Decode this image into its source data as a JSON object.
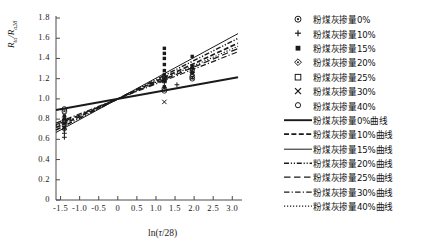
{
  "chart_data": {
    "type": "scatter",
    "title": "",
    "xlabel": "ln(τ/28)",
    "ylabel": "R_ta/R_a28",
    "xlim": [
      -1.62,
      3.15
    ],
    "ylim": [
      0,
      1.8
    ],
    "xticks": [
      "-1.5",
      "-1.0",
      "-0.5",
      "0",
      "0.5",
      "1.0",
      "1.5",
      "2.0",
      "2.5",
      "3.0"
    ],
    "xtick_values": [
      -1.5,
      -1.0,
      -0.5,
      0,
      0.5,
      1.0,
      1.5,
      2.0,
      2.5,
      3.0
    ],
    "yticks": [
      "0",
      "0.2",
      "0.4",
      "0.6",
      "0.8",
      "1.0",
      "1.2",
      "1.4",
      "1.6",
      "1.8"
    ],
    "ytick_values": [
      0,
      0.2,
      0.4,
      0.6,
      0.8,
      1.0,
      1.2,
      1.4,
      1.6,
      1.8
    ],
    "grid": false,
    "legend_position": "right",
    "series": [
      {
        "name": "粉煤灰掺量0%",
        "marker": "circle-dot",
        "points": [
          {
            "x": -1.4,
            "y": 0.9
          },
          {
            "x": -1.4,
            "y": 0.88
          },
          {
            "x": 1.22,
            "y": 1.08
          },
          {
            "x": 1.22,
            "y": 1.1
          },
          {
            "x": 1.95,
            "y": 1.22
          },
          {
            "x": 1.95,
            "y": 1.2
          }
        ]
      },
      {
        "name": "粉煤灰掺量10%",
        "marker": "plus",
        "points": [
          {
            "x": -1.4,
            "y": 0.62
          },
          {
            "x": -1.4,
            "y": 0.66
          },
          {
            "x": -1.4,
            "y": 0.7
          },
          {
            "x": 1.22,
            "y": 1.16
          },
          {
            "x": 1.22,
            "y": 1.2
          },
          {
            "x": 1.55,
            "y": 1.14
          },
          {
            "x": 1.95,
            "y": 1.26
          },
          {
            "x": 1.95,
            "y": 1.3
          }
        ]
      },
      {
        "name": "粉煤灰掺量15%",
        "marker": "filled-square",
        "points": [
          {
            "x": -1.4,
            "y": 0.72
          },
          {
            "x": -1.4,
            "y": 0.76
          },
          {
            "x": -1.4,
            "y": 0.8
          },
          {
            "x": -1.4,
            "y": 0.83
          },
          {
            "x": 1.22,
            "y": 1.5
          },
          {
            "x": 1.22,
            "y": 1.45
          },
          {
            "x": 1.22,
            "y": 1.4
          },
          {
            "x": 1.22,
            "y": 1.34
          },
          {
            "x": 1.22,
            "y": 1.28
          },
          {
            "x": 1.22,
            "y": 1.24
          },
          {
            "x": 1.22,
            "y": 1.18
          },
          {
            "x": 1.22,
            "y": 1.12
          },
          {
            "x": 1.95,
            "y": 1.42
          },
          {
            "x": 1.95,
            "y": 1.32
          },
          {
            "x": 1.95,
            "y": 1.26
          }
        ]
      },
      {
        "name": "粉煤灰掺量20%",
        "marker": "diamond",
        "points": [
          {
            "x": -1.4,
            "y": 0.79
          },
          {
            "x": -1.4,
            "y": 0.74
          },
          {
            "x": 1.22,
            "y": 1.22
          },
          {
            "x": 1.95,
            "y": 1.3
          }
        ]
      },
      {
        "name": "粉煤灰掺量25%",
        "marker": "open-square",
        "points": [
          {
            "x": -1.4,
            "y": 0.78
          },
          {
            "x": 1.22,
            "y": 1.19
          },
          {
            "x": 1.95,
            "y": 1.28
          }
        ]
      },
      {
        "name": "粉煤灰掺量30%",
        "marker": "cross",
        "points": [
          {
            "x": -1.4,
            "y": 0.84
          },
          {
            "x": 1.22,
            "y": 0.97
          },
          {
            "x": 1.95,
            "y": 1.21
          }
        ]
      },
      {
        "name": "粉煤灰掺量40%",
        "marker": "small-circle",
        "points": [
          {
            "x": -1.4,
            "y": 0.7
          },
          {
            "x": 1.22,
            "y": 1.21
          },
          {
            "x": 1.95,
            "y": 1.24
          }
        ]
      }
    ],
    "fit_lines": [
      {
        "name": "粉煤灰掺量0%曲线",
        "style": "solid-thick",
        "intercept": 1.0,
        "slope": 0.068
      },
      {
        "name": "粉煤灰掺量10%曲线",
        "style": "dashed",
        "intercept": 1.0,
        "slope": 0.175
      },
      {
        "name": "粉煤灰掺量15%曲线",
        "style": "solid-thin",
        "intercept": 1.0,
        "slope": 0.205
      },
      {
        "name": "粉煤灰掺量20%曲线",
        "style": "dash-dot-dot",
        "intercept": 1.0,
        "slope": 0.19
      },
      {
        "name": "粉煤灰掺量25%曲线",
        "style": "long-dash",
        "intercept": 1.0,
        "slope": 0.158
      },
      {
        "name": "粉煤灰掺量30%曲线",
        "style": "dash-dot",
        "intercept": 1.0,
        "slope": 0.148
      },
      {
        "name": "粉煤灰掺量40%曲线",
        "style": "dotted",
        "intercept": 1.0,
        "slope": 0.165
      }
    ]
  },
  "axes": {
    "ylabel_main": "R",
    "ylabel_sub1": "ta",
    "ylabel_slash": "/R",
    "ylabel_sub2": "a28",
    "xlabel_prefix": "ln(",
    "xlabel_sym": "τ",
    "xlabel_suffix": "/28)"
  },
  "legend": {
    "markers": [
      {
        "label": "粉煤灰掺量0%",
        "icon": "circle-dot-marker-icon"
      },
      {
        "label": "粉煤灰掺量10%",
        "icon": "plus-marker-icon"
      },
      {
        "label": "粉煤灰掺量15%",
        "icon": "filled-square-marker-icon"
      },
      {
        "label": "粉煤灰掺量20%",
        "icon": "diamond-marker-icon"
      },
      {
        "label": "粉煤灰掺量25%",
        "icon": "open-square-marker-icon"
      },
      {
        "label": "粉煤灰掺量30%",
        "icon": "cross-marker-icon"
      },
      {
        "label": "粉煤灰掺量40%",
        "icon": "small-circle-marker-icon"
      }
    ],
    "lines": [
      {
        "label": "粉煤灰掺量0%曲线",
        "icon": "solid-thick-line-icon"
      },
      {
        "label": "粉煤灰掺量10%曲线",
        "icon": "dashed-line-icon"
      },
      {
        "label": "粉煤灰掺量15%曲线",
        "icon": "solid-thin-line-icon"
      },
      {
        "label": "粉煤灰掺量20%曲线",
        "icon": "dash-dot-dot-line-icon"
      },
      {
        "label": "粉煤灰掺量25%曲线",
        "icon": "long-dash-line-icon"
      },
      {
        "label": "粉煤灰掺量30%曲线",
        "icon": "dash-dot-line-icon"
      },
      {
        "label": "粉煤灰掺量40%曲线",
        "icon": "dotted-line-icon"
      }
    ]
  },
  "colors": {
    "ink": "#1a1a1a",
    "axis": "#4a4a4a",
    "background": "#ffffff"
  }
}
